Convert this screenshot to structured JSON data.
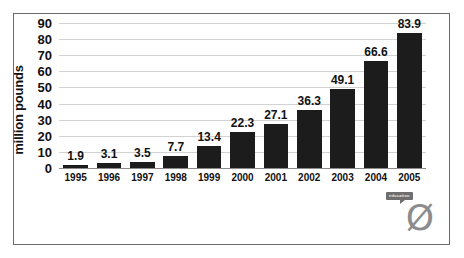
{
  "chart_data": {
    "type": "bar",
    "title": "",
    "xlabel": "",
    "ylabel": "million pounds",
    "categories": [
      "1995",
      "1996",
      "1997",
      "1998",
      "1999",
      "2000",
      "2001",
      "2002",
      "2003",
      "2004",
      "2005"
    ],
    "values": [
      1.9,
      3.1,
      3.5,
      7.7,
      13.4,
      22.3,
      27.1,
      36.3,
      49.1,
      66.6,
      83.9
    ],
    "data_labels": [
      "1.9",
      "3.1",
      "3.5",
      "7.7",
      "13.4",
      "22.3",
      "27.1",
      "36.3",
      "49.1",
      "66.6",
      "83.9"
    ],
    "ylim": [
      0,
      90
    ],
    "y_ticks": [
      0,
      10,
      20,
      30,
      40,
      50,
      60,
      70,
      80,
      90
    ],
    "y_tick_labels": [
      "0",
      "10",
      "20",
      "30",
      "40",
      "50",
      "60",
      "70",
      "80",
      "90"
    ],
    "grid": true,
    "legend": "none",
    "bar_color": "#1c1c1c",
    "gridline_color": "#d2d2d2",
    "axis_color": "#8a8a8a",
    "background": "#ffffff"
  },
  "logo": {
    "tag_text": "education",
    "glyph": "Ø",
    "tag_color": "#6e6e6e",
    "glyph_color": "#8c8c8c"
  }
}
